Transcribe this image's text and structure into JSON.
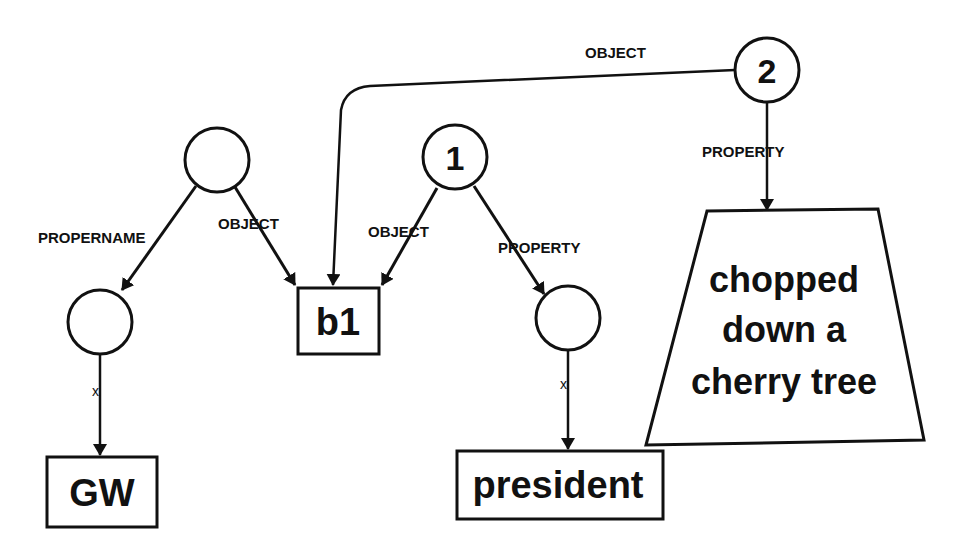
{
  "diagram": {
    "type": "semantic-network",
    "nodes": {
      "top_left": {
        "label": ""
      },
      "n1": {
        "label": "1"
      },
      "n2": {
        "label": "2"
      },
      "left_mid": {
        "label": ""
      },
      "right_mid": {
        "label": ""
      },
      "b1": {
        "label": "b1"
      },
      "gw": {
        "label": "GW"
      },
      "president": {
        "label": "president"
      },
      "cherry": {
        "lines": [
          "chopped",
          "down a",
          "cherry tree"
        ]
      }
    },
    "edges": {
      "top_left_to_left_mid": {
        "label": "PROPERNAME"
      },
      "top_left_to_b1": {
        "label": "OBJECT"
      },
      "n1_to_b1": {
        "label": "OBJECT"
      },
      "n1_to_right_mid": {
        "label": "PROPERTY"
      },
      "n2_to_b1": {
        "label": "OBJECT"
      },
      "n2_to_cherry": {
        "label": "PROPERTY"
      },
      "left_mid_to_gw": {
        "label": "x"
      },
      "right_mid_to_president": {
        "label": "x"
      }
    }
  }
}
